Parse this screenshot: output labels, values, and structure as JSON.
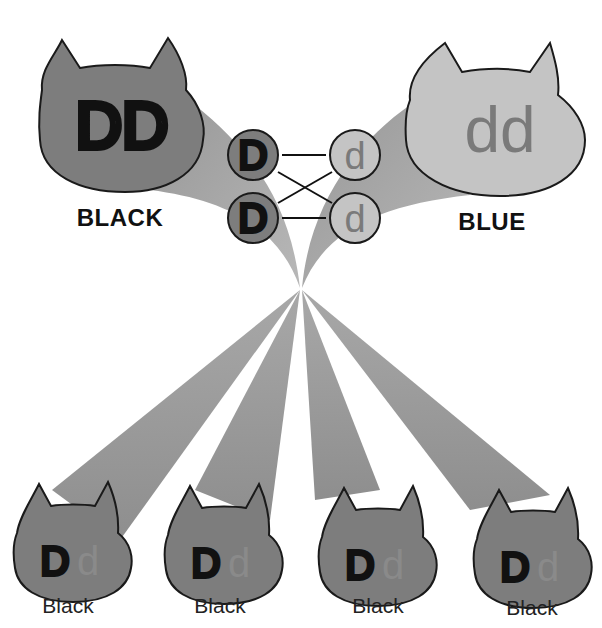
{
  "parents": [
    {
      "genotype": "DD",
      "label": "BLACK",
      "fill": "#7d7d7d",
      "text_color": "#111111"
    },
    {
      "genotype": "dd",
      "label": "BLUE",
      "fill": "#c4c4c4",
      "text_color": "#7a7a7a"
    }
  ],
  "gametes": {
    "left": [
      "D",
      "D"
    ],
    "right": [
      "d",
      "d"
    ],
    "left_fill": "#7d7d7d",
    "right_fill": "#c4c4c4"
  },
  "offspring": [
    {
      "allele1": "D",
      "allele2": "d",
      "label": "Black"
    },
    {
      "allele1": "D",
      "allele2": "d",
      "label": "Black"
    },
    {
      "allele1": "D",
      "allele2": "d",
      "label": "Black"
    },
    {
      "allele1": "D",
      "allele2": "d",
      "label": "Black"
    }
  ],
  "colors": {
    "beam": "#9a9a9a",
    "outline": "#1a1a1a",
    "dominant_text": "#111111",
    "recessive_text": "#7a7a7a"
  }
}
